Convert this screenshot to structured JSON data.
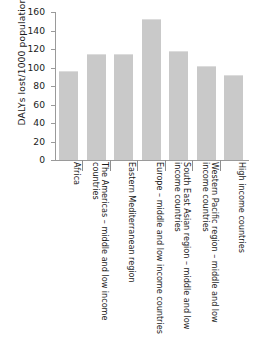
{
  "chart_data": {
    "type": "bar",
    "title": "",
    "xlabel": "",
    "ylabel": "DALYs lost/1000 population",
    "ylim": [
      0,
      160
    ],
    "ytick_step": 20,
    "grid": false,
    "legend": null,
    "bar_color": "#c9c9c9",
    "axis_color": "#9a9a9a",
    "categories": [
      "Africa",
      "The Americas – middle and low income countries",
      "Eastern Mediterranean region",
      "Europe – middle and low income countries",
      "South East Asian region – middle and low income countries",
      "Western Pacific region – middle and low income countries",
      "High income countries"
    ],
    "values": [
      96,
      115,
      115,
      152,
      118,
      102,
      92
    ],
    "yticks": [
      0,
      20,
      40,
      60,
      80,
      100,
      120,
      140,
      160
    ],
    "ytick_labels": [
      "0",
      "20",
      "40",
      "60",
      "80",
      "100",
      "120",
      "140",
      "160"
    ]
  }
}
